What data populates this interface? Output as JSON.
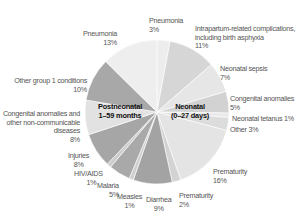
{
  "chart_data": {
    "type": "pie",
    "title": "",
    "start_angle_deg": 0,
    "direction": "clockwise",
    "groups": [
      {
        "name": "Neonatal (0–27 days)",
        "label_line1": "Neonatal",
        "label_line2": "(0–27 days)"
      },
      {
        "name": "Postneonatal 1–59 months",
        "label_line1": "Postneonatal",
        "label_line2": "1–59 months"
      }
    ],
    "slices": [
      {
        "label": "Pneumonia",
        "value": 3,
        "pct_text": "3%",
        "group": "Neonatal",
        "color": "#ededed"
      },
      {
        "label": "Intrapartum-related complications, including birth asphyxia",
        "value": 11,
        "pct_text": "11%",
        "group": "Neonatal",
        "color": "#d6d6d6"
      },
      {
        "label": "Neonatal sepsis",
        "value": 7,
        "pct_text": "7%",
        "group": "Neonatal",
        "color": "#e6e6e6"
      },
      {
        "label": "Congenital anomalies",
        "value": 5,
        "pct_text": "5%",
        "group": "Neonatal",
        "color": "#d2d2d2"
      },
      {
        "label": "Neonatal tetanus",
        "value": 1,
        "pct_text": "1%",
        "group": "Neonatal",
        "color": "#e9e9e9"
      },
      {
        "label": "Other",
        "value": 3,
        "pct_text": "3%",
        "group": "Neonatal",
        "color": "#dcdcdc"
      },
      {
        "label": "Prematurity",
        "value": 16,
        "pct_text": "16%",
        "group": "Neonatal",
        "color": "#e4e4e4"
      },
      {
        "label": "Prematurity",
        "value": 2,
        "pct_text": "2%",
        "group": "Neonatal",
        "color": "#d3d3d3"
      },
      {
        "label": "Diarrhea",
        "value": 9,
        "pct_text": "9%",
        "group": "Postneonatal",
        "color": "#a3a3a3"
      },
      {
        "label": "Measles",
        "value": 1,
        "pct_text": "1%",
        "group": "Postneonatal",
        "color": "#cfcfcf"
      },
      {
        "label": "Malaria",
        "value": 5,
        "pct_text": "5%",
        "group": "Postneonatal",
        "color": "#a9a9a9"
      },
      {
        "label": "HIV/AIDS",
        "value": 1,
        "pct_text": "1%",
        "group": "Postneonatal",
        "color": "#cdcdcd"
      },
      {
        "label": "Injuries",
        "value": 8,
        "pct_text": "8%",
        "group": "Postneonatal",
        "color": "#a6a6a6"
      },
      {
        "label": "Congenital anomalies and other non-communicable diseases",
        "value": 8,
        "pct_text": "8%",
        "group": "Postneonatal",
        "color": "#e2e2e2"
      },
      {
        "label": "Other group 1 conditions",
        "value": 10,
        "pct_text": "10%",
        "group": "Postneonatal",
        "color": "#a8a8a8"
      },
      {
        "label": "Pneumonia",
        "value": 13,
        "pct_text": "13%",
        "group": "Postneonatal",
        "color": "#eeeeee"
      }
    ]
  },
  "labels": {
    "neo_pneumonia": {
      "name": "Pneumonia",
      "pct": "3%"
    },
    "intrapartum": {
      "line1": "Intrapartum-related complications,",
      "line2": "including birth asphyxia",
      "pct": "11%"
    },
    "sepsis": {
      "name": "Neonatal sepsis",
      "pct": "7%"
    },
    "neo_congenital": {
      "name": "Congenital anomalies",
      "pct": "5%"
    },
    "tetanus": {
      "text": "Neonatal tetanus 1%"
    },
    "neo_other": {
      "text": "Other 3%"
    },
    "prematurity16": {
      "name": "Prematurity",
      "pct": "16%"
    },
    "prematurity2": {
      "name": "Prematurity",
      "pct": "2%"
    },
    "diarrhea": {
      "name": "Diarrhea",
      "pct": "9%"
    },
    "measles": {
      "name": "Measles",
      "pct": "1%"
    },
    "malaria": {
      "name": "Malaria",
      "pct": "5%"
    },
    "hiv": {
      "name": "HIV/AIDS",
      "pct": "1%"
    },
    "injuries": {
      "name": "Injuries",
      "pct": "8%"
    },
    "ncd": {
      "line1": "Congenital anomalies and",
      "line2": "other non-communicable",
      "line3": "diseases",
      "pct": "8%"
    },
    "group1": {
      "name": "Other group 1 conditions",
      "pct": "10%"
    },
    "post_pneumonia": {
      "name": "Pneumonia",
      "pct": "13%"
    },
    "center_post": {
      "line1": "Postneonatal",
      "line2": "1–59 months"
    },
    "center_neo": {
      "line1": "Neonatal",
      "line2": "(0–27 days)"
    }
  }
}
